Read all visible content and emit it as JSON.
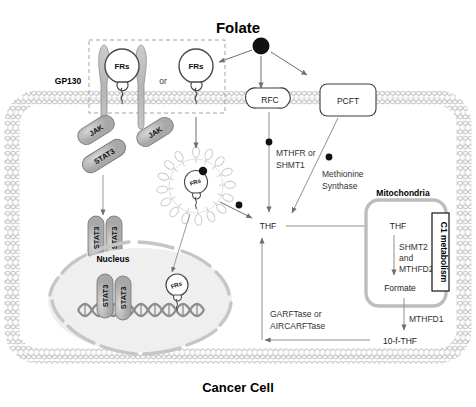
{
  "figure": {
    "title": "Folate",
    "bottom_label": "Cancer Cell",
    "background": "#ffffff"
  },
  "colors": {
    "membrane": "#c9c9c9",
    "protein_fill": "#b0b0b0",
    "receptor_fill": "#ffffff",
    "arrow": "#6f6f6f",
    "text": "#222222",
    "folate_dot": "#000000",
    "nucleus_fill": "#ededed",
    "mito_stroke": "#b4b4b4"
  },
  "receptor_box": {
    "gp130_label": "GP130",
    "or_label": "or",
    "frs_label_left": "FRs",
    "frs_label_right": "FRs",
    "jak_left": "JAK",
    "jak_right": "JAK"
  },
  "signaling": {
    "stat3_membrane": "STAT3",
    "stat3_dimer": [
      "STAT3",
      "STAT3"
    ],
    "stat3_nucleus": [
      "STAT3",
      "STAT3"
    ],
    "nucleus_label": "Nucleus",
    "nuclear_frs": "FRs"
  },
  "endosome": {
    "frs_label": "FRs"
  },
  "transporters": {
    "rfc": "RFC",
    "pcft": "PCFT"
  },
  "enzymes": {
    "mthfr_shmt1": "MTHFR or\nSHMT1",
    "mthfr_shmt1_line1": "MTHFR or",
    "mthfr_shmt1_line2": "SHMT1",
    "methionine_synthase_line1": "Methionine",
    "methionine_synthase_line2": "Synthase",
    "garftase_line1": "GARFTase or",
    "garftase_line2": "AIRCARFTase",
    "mthfd1": "MTHFD1",
    "shmt2_line1": "SHMT2",
    "shmt2_line2": "and",
    "shmt2_line3": "MTHFD2"
  },
  "metabolites": {
    "thf_cytosol": "THF",
    "thf_mito": "THF",
    "formate": "Formate",
    "ten_f_thf": "10-f-THF"
  },
  "mitochondria": {
    "label": "Mitochondria",
    "c1_label": "C1 metabolism"
  }
}
